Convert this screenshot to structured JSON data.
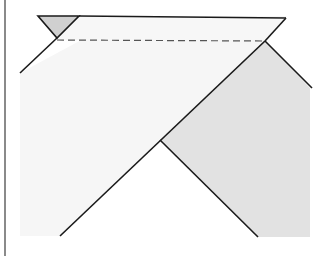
{
  "diagram": {
    "title": "",
    "colors": {
      "light_fill": "#f6f6f6",
      "gray_fill": "#e2e2e2",
      "water_marker_fill": "#d0d0d0",
      "line": "#1a1a1a",
      "dashed_line": "#555555",
      "frame_line": "#8a8a8a"
    },
    "elements": {
      "water_marker": "inverted triangle symbol",
      "water_level": "dashed horizontal line",
      "left_slope": "diagonal line",
      "right_slope": "diagonal line",
      "gray_region": "shaded soil region"
    }
  }
}
